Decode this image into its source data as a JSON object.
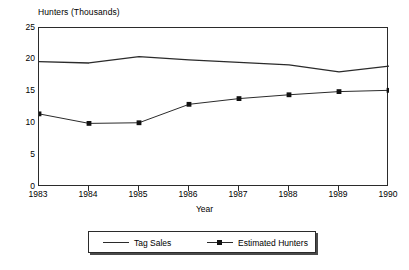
{
  "chart_data": {
    "type": "line",
    "title": "",
    "xlabel": "Year",
    "ylabel": "Hunters (Thousands)",
    "x": [
      1983,
      1984,
      1985,
      1986,
      1987,
      1988,
      1989,
      1990
    ],
    "categories": [
      "1983",
      "1984",
      "1985",
      "1986",
      "1987",
      "1988",
      "1989",
      "1990"
    ],
    "series": [
      {
        "name": "Tag Sales",
        "marker": "none",
        "values": [
          19.7,
          19.5,
          20.5,
          20.0,
          19.6,
          19.2,
          18.1,
          19.0
        ]
      },
      {
        "name": "Estimated Hunters",
        "marker": "square",
        "values": [
          11.5,
          10.0,
          10.1,
          13.0,
          13.9,
          14.5,
          15.0,
          15.2
        ]
      }
    ],
    "xlim": [
      1983,
      1990
    ],
    "ylim": [
      0,
      25
    ],
    "yticks": [
      0,
      5,
      10,
      15,
      20,
      25
    ],
    "ytick_labels": [
      "0",
      "5",
      "10",
      "15",
      "20",
      "25"
    ],
    "xticks": [
      1983,
      1984,
      1985,
      1986,
      1987,
      1988,
      1989,
      1990
    ],
    "grid": false,
    "legend_position": "bottom",
    "line_color": "#2b2b2b",
    "marker_color": "#111111",
    "frame_color": "#2b2b2b",
    "background": "#ffffff"
  },
  "legend": {
    "entries": [
      {
        "label": "Tag Sales",
        "marker": false
      },
      {
        "label": "Estimated Hunters",
        "marker": true
      }
    ]
  }
}
